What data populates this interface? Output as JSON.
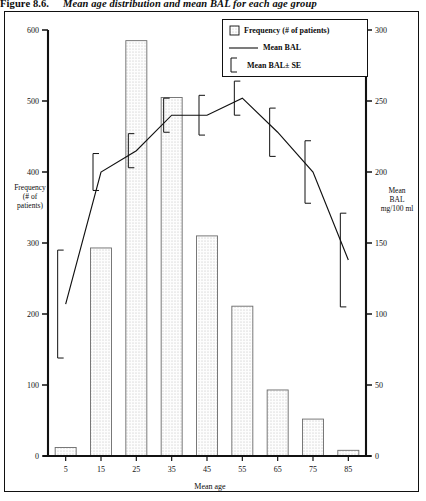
{
  "figure": {
    "number": "Figure 8.6.",
    "caption": "Mean age distribution and mean BAL for each age group"
  },
  "legend": {
    "items": [
      {
        "marker": "hatched-square-swatch",
        "label": "Frequency (# of patients)"
      },
      {
        "marker": "line-segment",
        "label": "Mean BAL"
      },
      {
        "marker": "error-bracket",
        "label": "Mean BAL± SE"
      }
    ]
  },
  "axes": {
    "left": {
      "title": "Frequency (# of patients)",
      "title_lines": [
        "Frequency",
        "(# of",
        "patients)"
      ],
      "ticks": [
        0,
        100,
        200,
        300,
        400,
        500,
        600
      ],
      "min": 0,
      "max": 600
    },
    "right": {
      "title": "Mean BAL mg/100 ml",
      "title_lines": [
        "Mean",
        "BAL",
        "mg/100 ml"
      ],
      "ticks": [
        0,
        50,
        100,
        150,
        200,
        250,
        300
      ],
      "min": 0,
      "max": 300
    },
    "x": {
      "title": "Mean age",
      "ticks": [
        5,
        15,
        25,
        35,
        45,
        55,
        65,
        75,
        85
      ]
    }
  },
  "chart_data": {
    "type": "bar",
    "title": "Mean age distribution and mean BAL for each age group",
    "xlabel": "Mean age",
    "ylabel": "Frequency (# of patients)",
    "y2label": "Mean BAL mg/100 ml",
    "categories": [
      5,
      15,
      25,
      35,
      45,
      55,
      65,
      75,
      85
    ],
    "ylim": [
      0,
      600
    ],
    "y2lim": [
      0,
      300
    ],
    "grid": false,
    "legend_position": "top-right",
    "series": [
      {
        "name": "Frequency (# of patients)",
        "type": "bar",
        "axis": "left",
        "values": [
          12,
          293,
          585,
          505,
          310,
          211,
          93,
          52,
          8
        ]
      },
      {
        "name": "Mean BAL",
        "type": "line",
        "axis": "right",
        "values": [
          107,
          200,
          215,
          240,
          240,
          252,
          228,
          200,
          138
        ],
        "errors_se": [
          38,
          13,
          12,
          12,
          14,
          12,
          17,
          22,
          33
        ]
      }
    ]
  }
}
